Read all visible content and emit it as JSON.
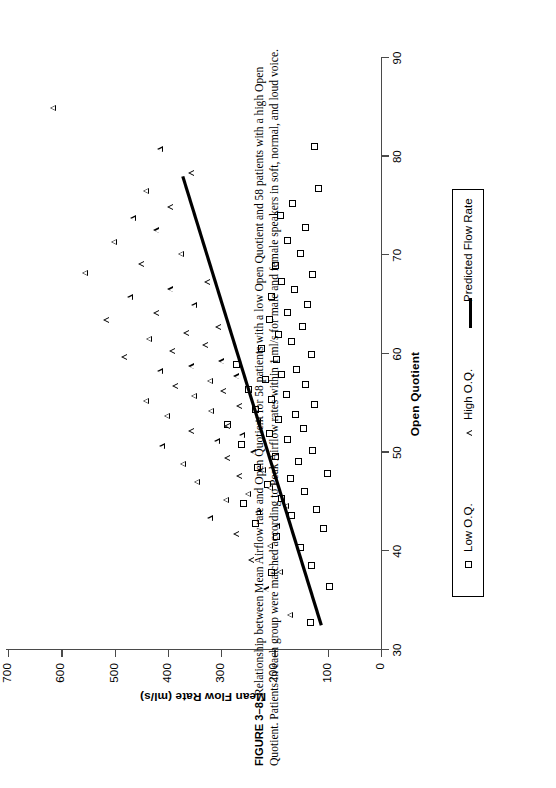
{
  "figure": {
    "label": "FIGURE 3–8.",
    "caption": "Relationship between Mean Airflow rate and Open Quotient for 58 patients with a low Open Quotient and 58 patients with a high Open Quotient. Patients in each group were matched according to Peak Airflow rates within 1 ml/s for male and female speakers in soft, normal, and loud voice."
  },
  "legend": {
    "items": [
      {
        "label": "Low O.Q.",
        "marker": "square-marker"
      },
      {
        "label": "High O.Q.",
        "marker": "triangle-marker"
      },
      {
        "label": "Predicted Flow Rate",
        "marker": "line-marker"
      }
    ]
  },
  "chart_data": {
    "type": "scatter",
    "title": "",
    "xlabel": "Open Quotient",
    "ylabel": "Mean Flow Rate (ml/s)",
    "xlim": [
      30,
      90
    ],
    "ylim": [
      0,
      700
    ],
    "xticks": [
      30,
      40,
      50,
      60,
      70,
      80,
      90
    ],
    "yticks": [
      0,
      100,
      200,
      300,
      400,
      500,
      600,
      700
    ],
    "grid": false,
    "legend_position": "below-axes",
    "series": [
      {
        "name": "Low O.Q.",
        "marker": "open-square",
        "points": [
          [
            32.8,
            133
          ],
          [
            36.4,
            97
          ],
          [
            37.8,
            205
          ],
          [
            38.6,
            131
          ],
          [
            40.4,
            152
          ],
          [
            41.5,
            196
          ],
          [
            42.3,
            108
          ],
          [
            42.8,
            235
          ],
          [
            43.6,
            168
          ],
          [
            44.2,
            122
          ],
          [
            44.8,
            258
          ],
          [
            45.4,
            186
          ],
          [
            46.1,
            143
          ],
          [
            46.8,
            214
          ],
          [
            47.4,
            170
          ],
          [
            47.9,
            101
          ],
          [
            48.5,
            232
          ],
          [
            49.1,
            155
          ],
          [
            49.6,
            198
          ],
          [
            50.2,
            128
          ],
          [
            50.8,
            262
          ],
          [
            51.3,
            176
          ],
          [
            51.9,
            210
          ],
          [
            52.4,
            146
          ],
          [
            52.9,
            288
          ],
          [
            53.4,
            192
          ],
          [
            53.9,
            160
          ],
          [
            54.4,
            236
          ],
          [
            54.9,
            124
          ],
          [
            55.4,
            205
          ],
          [
            55.9,
            178
          ],
          [
            56.4,
            248
          ],
          [
            56.9,
            142
          ],
          [
            57.4,
            216
          ],
          [
            57.9,
            186
          ],
          [
            58.4,
            158
          ],
          [
            58.9,
            272
          ],
          [
            59.4,
            196
          ],
          [
            59.9,
            130
          ],
          [
            60.6,
            224
          ],
          [
            61.3,
            168
          ],
          [
            62.0,
            192
          ],
          [
            62.8,
            148
          ],
          [
            63.5,
            210
          ],
          [
            64.2,
            176
          ],
          [
            65.0,
            138
          ],
          [
            65.8,
            205
          ],
          [
            66.5,
            162
          ],
          [
            67.3,
            186
          ],
          [
            68.1,
            128
          ],
          [
            69.0,
            198
          ],
          [
            70.2,
            152
          ],
          [
            71.5,
            176
          ],
          [
            72.8,
            142
          ],
          [
            74.0,
            188
          ],
          [
            75.2,
            166
          ],
          [
            76.8,
            118
          ],
          [
            81.0,
            125
          ]
        ]
      },
      {
        "name": "High O.Q.",
        "marker": "open-triangle",
        "points": [
          [
            33.6,
            168
          ],
          [
            36.2,
            212
          ],
          [
            38.0,
            186
          ],
          [
            39.2,
            240
          ],
          [
            40.6,
            205
          ],
          [
            41.8,
            268
          ],
          [
            42.6,
            192
          ],
          [
            43.4,
            318
          ],
          [
            44.0,
            228
          ],
          [
            44.7,
            175
          ],
          [
            45.3,
            288
          ],
          [
            45.9,
            246
          ],
          [
            46.5,
            205
          ],
          [
            47.1,
            342
          ],
          [
            47.7,
            262
          ],
          [
            48.3,
            218
          ],
          [
            48.9,
            368
          ],
          [
            49.5,
            285
          ],
          [
            50.1,
            236
          ],
          [
            50.7,
            408
          ],
          [
            51.2,
            305
          ],
          [
            51.8,
            258
          ],
          [
            52.3,
            352
          ],
          [
            52.8,
            285
          ],
          [
            53.3,
            228
          ],
          [
            53.8,
            398
          ],
          [
            54.3,
            316
          ],
          [
            54.8,
            262
          ],
          [
            55.3,
            438
          ],
          [
            55.8,
            348
          ],
          [
            56.3,
            292
          ],
          [
            56.8,
            382
          ],
          [
            57.3,
            318
          ],
          [
            57.8,
            268
          ],
          [
            58.3,
            412
          ],
          [
            58.8,
            352
          ],
          [
            59.3,
            296
          ],
          [
            59.8,
            478
          ],
          [
            60.4,
            388
          ],
          [
            61.0,
            326
          ],
          [
            61.6,
            432
          ],
          [
            62.2,
            362
          ],
          [
            62.8,
            302
          ],
          [
            63.5,
            512
          ],
          [
            64.2,
            418
          ],
          [
            65.0,
            348
          ],
          [
            65.8,
            468
          ],
          [
            66.6,
            392
          ],
          [
            67.4,
            322
          ],
          [
            68.3,
            552
          ],
          [
            69.2,
            446
          ],
          [
            70.2,
            372
          ],
          [
            71.4,
            498
          ],
          [
            72.6,
            418
          ],
          [
            73.8,
            462
          ],
          [
            75.0,
            392
          ],
          [
            76.6,
            438
          ],
          [
            78.4,
            352
          ],
          [
            80.8,
            412
          ],
          [
            85.0,
            612
          ]
        ]
      }
    ],
    "fit_line": {
      "name": "Predicted Flow Rate",
      "x_start": 32.5,
      "y_start": 112,
      "x_end": 78.0,
      "y_end": 372
    }
  }
}
